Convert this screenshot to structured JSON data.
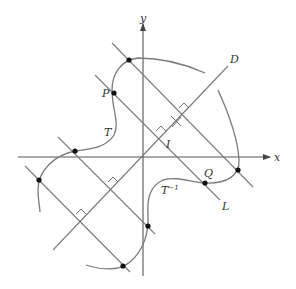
{
  "figure": {
    "axes": {
      "x_label": "x",
      "y_label": "y"
    },
    "labels": {
      "P": "P",
      "Q": "Q",
      "T": "T",
      "T_inv_base": "T",
      "T_inv_sup": "−1",
      "I": "I",
      "D": "D",
      "L": "L"
    },
    "points": [
      {
        "name": "top-point",
        "x": 129,
        "y": 60
      },
      {
        "name": "P",
        "x": 114,
        "y": 93
      },
      {
        "name": "left-upper-point",
        "x": 75,
        "y": 151
      },
      {
        "name": "left-point",
        "x": 39,
        "y": 180
      },
      {
        "name": "right-point",
        "x": 238,
        "y": 170
      },
      {
        "name": "Q",
        "x": 205,
        "y": 183
      },
      {
        "name": "lower-point",
        "x": 148,
        "y": 226
      },
      {
        "name": "bottom-point",
        "x": 123,
        "y": 266
      }
    ],
    "colors": {
      "curve": "#7a7a7a",
      "axis": "#555555",
      "point": "#111111",
      "text": "#333333"
    }
  }
}
